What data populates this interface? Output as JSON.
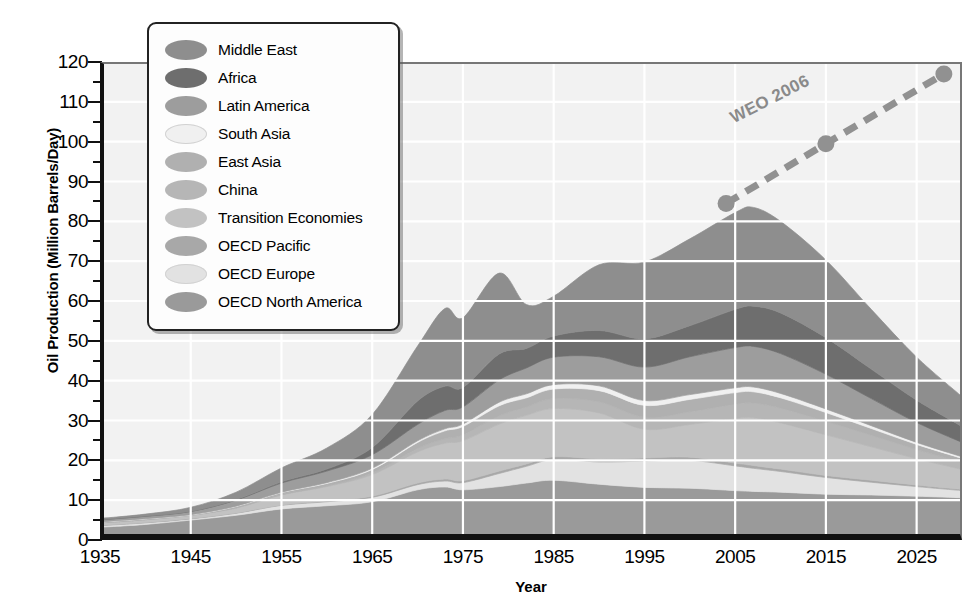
{
  "chart_data": {
    "type": "area",
    "title": "",
    "xlabel": "Year",
    "ylabel": "Oil Production (Million Barrels/Day)",
    "xlim": [
      1935,
      2030
    ],
    "ylim": [
      0,
      120
    ],
    "xticks": [
      1935,
      1945,
      1955,
      1965,
      1975,
      1985,
      1995,
      2005,
      2015,
      2025
    ],
    "yticks": [
      0,
      10,
      20,
      30,
      40,
      50,
      60,
      70,
      80,
      90,
      100,
      110,
      120
    ],
    "y_minor_step": 5,
    "grid": true,
    "grid_color": "#ffffff",
    "plot_background": "#f2f2f2",
    "legend_position": "top-left",
    "stack_order_bottom_to_top": [
      "OECD North America",
      "OECD Europe",
      "OECD Pacific",
      "Transition Economies",
      "China",
      "East Asia",
      "South Asia",
      "Latin America",
      "Africa",
      "Middle East"
    ],
    "x": [
      1935,
      1940,
      1945,
      1950,
      1955,
      1960,
      1965,
      1970,
      1973,
      1975,
      1979,
      1982,
      1985,
      1990,
      1995,
      2000,
      2005,
      2007,
      2010,
      2015,
      2020,
      2025,
      2030
    ],
    "series": [
      {
        "name": "OECD North America",
        "color": "#9a9a9a",
        "values": [
          3.2,
          3.9,
          5.0,
          6.2,
          7.8,
          8.6,
          9.6,
          12.6,
          13.3,
          12.6,
          13.4,
          14.3,
          15.0,
          14.0,
          13.2,
          13.0,
          12.4,
          12.2,
          12.0,
          11.5,
          11.3,
          11.0,
          10.6
        ]
      },
      {
        "name": "OECD Europe",
        "color": "#e2e2e2",
        "values": [
          0.4,
          0.4,
          0.3,
          0.5,
          0.9,
          1.0,
          1.1,
          1.3,
          1.5,
          1.8,
          3.3,
          4.2,
          5.2,
          5.6,
          6.6,
          7.0,
          6.2,
          5.8,
          5.2,
          4.2,
          3.2,
          2.4,
          1.8
        ]
      },
      {
        "name": "OECD Pacific",
        "color": "#a8a8a8",
        "values": [
          0.1,
          0.1,
          0.1,
          0.1,
          0.1,
          0.2,
          0.3,
          0.4,
          0.5,
          0.5,
          0.6,
          0.6,
          0.7,
          0.8,
          0.8,
          0.8,
          0.7,
          0.7,
          0.6,
          0.5,
          0.5,
          0.4,
          0.3
        ]
      },
      {
        "name": "Transition Economies",
        "color": "#c2c2c2",
        "values": [
          0.6,
          0.7,
          0.8,
          1.2,
          2.5,
          3.6,
          5.4,
          7.8,
          9.0,
          10.0,
          11.8,
          12.2,
          12.1,
          11.5,
          7.2,
          8.2,
          11.2,
          12.0,
          11.6,
          10.2,
          8.4,
          6.6,
          5.0
        ]
      },
      {
        "name": "China",
        "color": "#b6b6b6",
        "values": [
          0.0,
          0.0,
          0.0,
          0.1,
          0.1,
          0.2,
          0.5,
          0.9,
          1.1,
          1.5,
          2.1,
          2.1,
          2.5,
          2.8,
          3.0,
          3.2,
          3.6,
          3.7,
          3.7,
          3.4,
          2.9,
          2.3,
          1.8
        ]
      },
      {
        "name": "East Asia",
        "color": "#b0b0b0",
        "values": [
          0.2,
          0.2,
          0.1,
          0.3,
          0.5,
          0.6,
          0.8,
          1.5,
          2.0,
          2.1,
          2.5,
          2.3,
          2.4,
          2.8,
          3.0,
          3.1,
          2.9,
          2.8,
          2.6,
          2.2,
          1.7,
          1.3,
          1.0
        ]
      },
      {
        "name": "South Asia",
        "color": "#f0f0f0",
        "values": [
          0.05,
          0.05,
          0.05,
          0.1,
          0.1,
          0.2,
          0.3,
          0.4,
          0.5,
          0.6,
          0.9,
          1.0,
          1.1,
          1.2,
          1.2,
          1.2,
          1.2,
          1.2,
          1.1,
          0.9,
          0.7,
          0.5,
          0.4
        ]
      },
      {
        "name": "Latin America",
        "color": "#9d9d9d",
        "values": [
          0.5,
          0.6,
          0.8,
          1.5,
          2.3,
          2.9,
          3.4,
          4.1,
          4.6,
          4.3,
          5.6,
          6.5,
          6.9,
          7.3,
          8.4,
          9.5,
          10.1,
          10.2,
          10.0,
          8.7,
          6.8,
          5.0,
          3.6
        ]
      },
      {
        "name": "Africa",
        "color": "#6e6e6e",
        "values": [
          0.05,
          0.05,
          0.05,
          0.1,
          0.3,
          0.5,
          1.8,
          5.9,
          6.1,
          4.9,
          6.5,
          4.9,
          5.3,
          6.6,
          7.1,
          7.8,
          9.6,
          10.1,
          10.2,
          9.2,
          7.4,
          5.6,
          4.0
        ]
      },
      {
        "name": "Middle East",
        "color": "#8e8e8e",
        "values": [
          0.3,
          0.5,
          1.0,
          1.9,
          3.5,
          5.3,
          8.3,
          13.8,
          19.5,
          17.5,
          20.3,
          11.0,
          10.0,
          16.5,
          19.3,
          21.8,
          24.3,
          24.8,
          23.0,
          19.5,
          15.0,
          10.8,
          7.5
        ]
      }
    ],
    "annotation_series": {
      "name": "WEO 2006",
      "label": "WEO 2006",
      "style": "dashed-line-with-markers",
      "color": "#919191",
      "points": [
        {
          "x": 2004,
          "y": 84.5
        },
        {
          "x": 2015,
          "y": 99.5
        },
        {
          "x": 2028,
          "y": 117.0
        }
      ]
    }
  },
  "legend": {
    "items": [
      {
        "label": "Middle East",
        "color": "#8e8e8e"
      },
      {
        "label": "Africa",
        "color": "#6e6e6e"
      },
      {
        "label": "Latin America",
        "color": "#9d9d9d"
      },
      {
        "label": "South Asia",
        "color": "#f0f0f0"
      },
      {
        "label": "East Asia",
        "color": "#b0b0b0"
      },
      {
        "label": "China",
        "color": "#b6b6b6"
      },
      {
        "label": "Transition Economies",
        "color": "#c2c2c2"
      },
      {
        "label": "OECD Pacific",
        "color": "#a8a8a8"
      },
      {
        "label": "OECD Europe",
        "color": "#e2e2e2"
      },
      {
        "label": "OECD North America",
        "color": "#9a9a9a"
      }
    ]
  }
}
